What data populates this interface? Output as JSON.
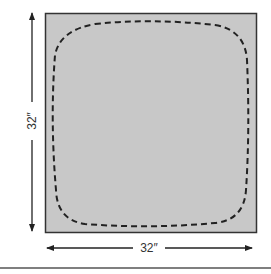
{
  "diagram": {
    "width_label": "32″",
    "height_label": "32″",
    "colors": {
      "panel_fill": "#c8c8c8",
      "panel_stroke": "#333333",
      "dashed_line": "#222222",
      "arrow": "#222222",
      "rule": "#555555"
    }
  }
}
